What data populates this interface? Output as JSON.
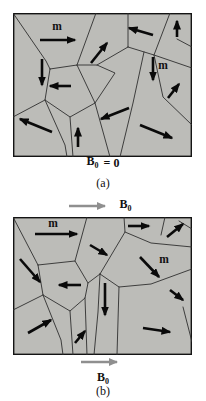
{
  "colors": {
    "grain_fill": "#bcbcb8",
    "grain_boundary": "#2f2f2f",
    "panel_border": "#141414",
    "moment_arrow": "#0a0a0a",
    "field_arrow": "#8f8f8f",
    "text": "#111111"
  },
  "labels": {
    "moment_symbol": "m",
    "field_zero": {
      "vector": "B",
      "sub": "0",
      "eq": "= 0"
    },
    "field_top": {
      "vector": "B",
      "sub": "0"
    },
    "field_bottom": {
      "vector": "B",
      "sub": "0"
    },
    "caption_a": "(a)",
    "caption_b": "(b)"
  },
  "panels": [
    {
      "id": "a",
      "x": 13,
      "y": 13,
      "width": 179,
      "height": 144,
      "boundaries": [
        [
          [
            0,
            0
          ],
          [
            33,
            48
          ],
          [
            37,
            56
          ]
        ],
        [
          [
            37,
            56
          ],
          [
            64,
            52
          ],
          [
            82,
            90
          ],
          [
            57,
            104
          ],
          [
            32,
            87
          ],
          [
            37,
            56
          ]
        ],
        [
          [
            32,
            87
          ],
          [
            0,
            104
          ]
        ],
        [
          [
            32,
            87
          ],
          [
            52,
            132
          ],
          [
            54,
            144
          ]
        ],
        [
          [
            57,
            104
          ],
          [
            60,
            144
          ]
        ],
        [
          [
            82,
            90
          ],
          [
            97,
            144
          ]
        ],
        [
          [
            64,
            52
          ],
          [
            83,
            0
          ]
        ],
        [
          [
            64,
            52
          ],
          [
            84,
            52
          ],
          [
            102,
            60
          ],
          [
            82,
            90
          ]
        ],
        [
          [
            115,
            0
          ],
          [
            115,
            34
          ]
        ],
        [
          [
            115,
            34
          ],
          [
            84,
            52
          ]
        ],
        [
          [
            115,
            34
          ],
          [
            141,
            42
          ],
          [
            179,
            55
          ]
        ],
        [
          [
            131,
            39
          ],
          [
            120,
            90
          ],
          [
            107,
            144
          ]
        ],
        [
          [
            157,
            0
          ],
          [
            141,
            42
          ]
        ],
        [
          [
            141,
            42
          ],
          [
            150,
            84
          ],
          [
            179,
            112
          ]
        ],
        [
          [
            164,
            26
          ],
          [
            179,
            34
          ]
        ]
      ],
      "arrows": [
        [
          27,
          27,
          62,
          27
        ],
        [
          29,
          46,
          29,
          72
        ],
        [
          78,
          50,
          94,
          30
        ],
        [
          140,
          22,
          116,
          15
        ],
        [
          164,
          24,
          164,
          8
        ],
        [
          140,
          44,
          140,
          67
        ],
        [
          58,
          73,
          37,
          73
        ],
        [
          39,
          119,
          7,
          106
        ],
        [
          65,
          134,
          65,
          115
        ],
        [
          116,
          95,
          88,
          106
        ],
        [
          155,
          85,
          166,
          71
        ],
        [
          127,
          112,
          159,
          125
        ]
      ],
      "moment_labels": [
        {
          "x": 44,
          "y": 17
        },
        {
          "x": 150,
          "y": 56
        }
      ]
    },
    {
      "id": "b",
      "x": 13,
      "y": 217,
      "width": 179,
      "height": 138,
      "boundaries": [
        [
          [
            0,
            0
          ],
          [
            25,
            48
          ]
        ],
        [
          [
            25,
            48
          ],
          [
            62,
            44
          ],
          [
            75,
            66
          ],
          [
            72,
            81
          ],
          [
            57,
            94
          ],
          [
            30,
            78
          ],
          [
            25,
            48
          ]
        ],
        [
          [
            30,
            78
          ],
          [
            0,
            93
          ]
        ],
        [
          [
            30,
            78
          ],
          [
            48,
            123
          ],
          [
            50,
            138
          ]
        ],
        [
          [
            57,
            94
          ],
          [
            60,
            138
          ]
        ],
        [
          [
            72,
            81
          ],
          [
            74,
            138
          ]
        ],
        [
          [
            62,
            44
          ],
          [
            74,
            0
          ]
        ],
        [
          [
            75,
            66
          ],
          [
            87,
            57
          ]
        ],
        [
          [
            87,
            57
          ],
          [
            85,
            95
          ],
          [
            81,
            138
          ]
        ],
        [
          [
            111,
            0
          ],
          [
            112,
            15
          ],
          [
            87,
            57
          ]
        ],
        [
          [
            112,
            15
          ],
          [
            138,
            26
          ],
          [
            179,
            30
          ]
        ],
        [
          [
            148,
            18
          ],
          [
            152,
            0
          ]
        ],
        [
          [
            87,
            57
          ],
          [
            106,
            70
          ],
          [
            138,
            67
          ],
          [
            179,
            52
          ]
        ],
        [
          [
            106,
            70
          ],
          [
            104,
            138
          ]
        ],
        [
          [
            166,
            4
          ],
          [
            179,
            12
          ]
        ],
        [
          [
            170,
            90
          ],
          [
            179,
            125
          ]
        ]
      ],
      "arrows": [
        [
          22,
          17,
          64,
          17
        ],
        [
          7,
          42,
          27,
          65
        ],
        [
          68,
          68,
          46,
          68
        ],
        [
          77,
          28,
          94,
          38
        ],
        [
          115,
          9,
          136,
          9
        ],
        [
          154,
          20,
          170,
          7
        ],
        [
          127,
          40,
          146,
          60
        ],
        [
          92,
          66,
          92,
          98
        ],
        [
          15,
          116,
          38,
          103
        ],
        [
          62,
          126,
          72,
          114
        ],
        [
          157,
          73,
          170,
          83
        ],
        [
          130,
          111,
          157,
          115
        ]
      ],
      "moment_labels": [
        {
          "x": 40,
          "y": 10
        },
        {
          "x": 151,
          "y": 46
        }
      ]
    }
  ]
}
